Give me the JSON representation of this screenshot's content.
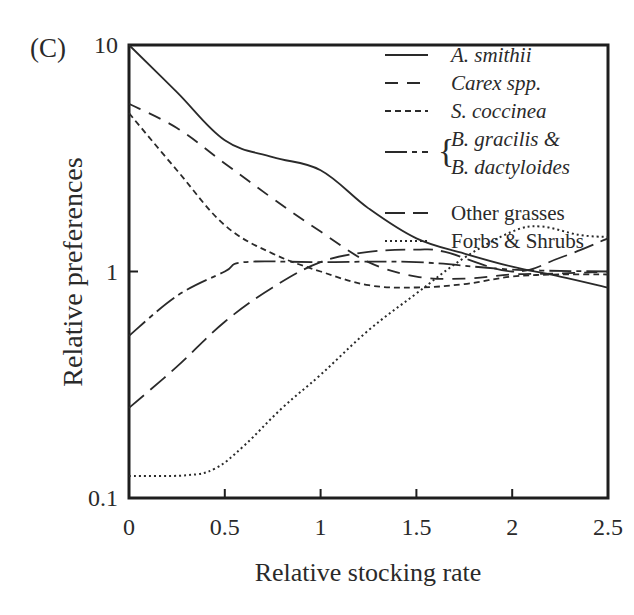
{
  "chart_data": {
    "type": "line",
    "panel_label": "(C)",
    "title": "",
    "xlabel": "Relative stocking rate",
    "ylabel": "Relative preferences",
    "xlim": [
      0,
      2.5
    ],
    "ylim": [
      0.1,
      10
    ],
    "yscale": "log",
    "xticks": [
      0,
      0.5,
      1,
      1.5,
      2,
      2.5
    ],
    "xtick_labels": [
      "0",
      "0.5",
      "1",
      "1.5",
      "2",
      "2.5"
    ],
    "yticks": [
      0.1,
      1,
      10
    ],
    "ytick_labels": [
      "0.1",
      "1",
      "10"
    ],
    "grid": false,
    "legend_position": "upper right",
    "series": [
      {
        "name": "A. smithii",
        "style": "solid",
        "italic": true,
        "x": [
          0,
          0.25,
          0.5,
          0.75,
          1.0,
          1.25,
          1.5,
          1.75,
          2.0,
          2.25,
          2.5
        ],
        "values": [
          10,
          6.2,
          3.8,
          3.2,
          2.8,
          1.9,
          1.4,
          1.2,
          1.05,
          0.95,
          0.85
        ]
      },
      {
        "name": "Carex spp.",
        "style": "dashed",
        "italic": true,
        "x": [
          0,
          0.25,
          0.5,
          0.75,
          1.0,
          1.25,
          1.5,
          1.75,
          2.0,
          2.25,
          2.5
        ],
        "values": [
          5.5,
          4.3,
          3.0,
          2.1,
          1.5,
          1.1,
          0.95,
          0.93,
          0.97,
          0.98,
          1.0
        ]
      },
      {
        "name": "S. coccinea",
        "style": "short-dashed",
        "italic": true,
        "x": [
          0,
          0.25,
          0.5,
          0.75,
          1.0,
          1.25,
          1.5,
          1.75,
          2.0,
          2.25,
          2.5
        ],
        "values": [
          5.0,
          2.8,
          1.6,
          1.2,
          1.0,
          0.87,
          0.85,
          0.88,
          0.95,
          0.97,
          0.97
        ]
      },
      {
        "name": "B. gracilis & B. dactyloides",
        "style": "dash-dot",
        "italic": true,
        "legend_lines": [
          "B. gracilis &",
          "B. dactyloides"
        ],
        "x": [
          0,
          0.25,
          0.5,
          0.6,
          1.0,
          1.5,
          2.0,
          2.5
        ],
        "values": [
          0.52,
          0.78,
          1.0,
          1.1,
          1.1,
          1.1,
          1.02,
          1.0
        ]
      },
      {
        "name": "Other grasses",
        "style": "long-dashed",
        "italic": false,
        "x": [
          0,
          0.25,
          0.5,
          0.75,
          1.0,
          1.25,
          1.5,
          1.65,
          2.0,
          2.25,
          2.5
        ],
        "values": [
          0.25,
          0.38,
          0.6,
          0.85,
          1.1,
          1.22,
          1.25,
          1.22,
          1.0,
          1.15,
          1.4
        ]
      },
      {
        "name": "Forbs & Shrubs",
        "style": "dotted",
        "italic": false,
        "x": [
          0,
          0.3,
          0.45,
          0.6,
          0.8,
          1.0,
          1.25,
          1.5,
          1.75,
          2.0,
          2.15,
          2.35,
          2.5
        ],
        "values": [
          0.125,
          0.126,
          0.135,
          0.17,
          0.25,
          0.35,
          0.55,
          0.8,
          1.15,
          1.5,
          1.58,
          1.45,
          1.42
        ]
      }
    ]
  }
}
